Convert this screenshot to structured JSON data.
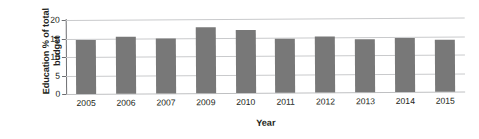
{
  "chart_data": {
    "type": "bar",
    "title": "",
    "xlabel": "Year",
    "ylabel": "Education % of total\nbudget",
    "categories": [
      "2005",
      "2006",
      "2007",
      "2009",
      "2010",
      "2011",
      "2012",
      "2013",
      "2014",
      "2015"
    ],
    "values": [
      14.7,
      15.3,
      15.0,
      17.8,
      17.1,
      14.5,
      15.2,
      14.4,
      14.7,
      14.0
    ],
    "series": [
      {
        "name": "Education % of total budget",
        "values": [
          14.7,
          15.3,
          15.0,
          17.8,
          17.1,
          14.5,
          15.2,
          14.4,
          14.7,
          14.0
        ]
      }
    ],
    "ylim": [
      0,
      20
    ],
    "ytick_labels": [
      "0",
      "5",
      "10",
      "15",
      "20"
    ],
    "ytick_values": [
      0,
      5,
      10,
      15,
      20
    ],
    "grid": "horizontal",
    "legend": "none",
    "bar_color": "#787878",
    "gridline_color": "#c9cacc",
    "axis_color": "#6d6e71",
    "text_color": "#231f20",
    "background_color": "#ffffff"
  }
}
